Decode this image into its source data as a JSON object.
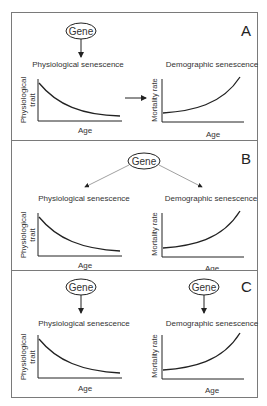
{
  "figure": {
    "panels": [
      {
        "id": "A",
        "letter": "A",
        "gene_label": "Gene",
        "left_graph": {
          "title": "Physiological senescence",
          "ylabel_line1": "Physiological",
          "ylabel_line2": "trait",
          "xlabel": "Age",
          "trend": "decreasing"
        },
        "right_graph": {
          "title": "Demographic senescence",
          "ylabel": "Mortality rate",
          "xlabel": "Age",
          "trend": "increasing"
        },
        "relationship": "Gene → Physiological senescence → Demographic senescence"
      },
      {
        "id": "B",
        "letter": "B",
        "gene_label": "Gene",
        "left_graph": {
          "title": "Physiological senescence",
          "ylabel_line1": "Physiological",
          "ylabel_line2": "trait",
          "xlabel": "Age",
          "trend": "decreasing"
        },
        "right_graph": {
          "title": "Demographic senescence",
          "ylabel": "Mortality rate",
          "xlabel": "Age",
          "trend": "increasing"
        },
        "relationship": "Gene → both Physiological and Demographic senescence"
      },
      {
        "id": "C",
        "letter": "C",
        "gene_label_left": "Gene",
        "gene_label_right": "Gene",
        "left_graph": {
          "title": "Physiological senescence",
          "ylabel_line1": "Physiological",
          "ylabel_line2": "trait",
          "xlabel": "Age",
          "trend": "decreasing"
        },
        "right_graph": {
          "title": "Demographic senescence",
          "ylabel": "Mortality rate",
          "xlabel": "Age",
          "trend": "increasing"
        },
        "relationship": "Separate genes → each senescence type"
      }
    ],
    "colors": {
      "line": "#222222",
      "arrow_b": "#888888",
      "border": "#7a7a7a",
      "text": "#333333"
    }
  }
}
